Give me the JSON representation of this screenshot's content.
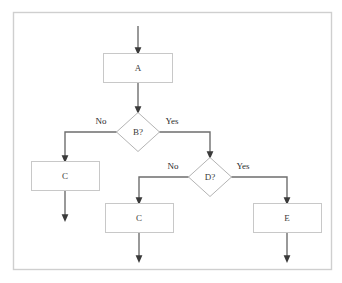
{
  "diagram": {
    "type": "flowchart",
    "frame": {
      "visible": true,
      "border_color": "#cfcfcf"
    },
    "colors": {
      "box_stroke": "#c8c8c8",
      "diamond_stroke": "#b4b4b4",
      "connector": "#6e6e6e",
      "text": "#3b3b3b",
      "background": "#ffffff"
    },
    "nodes": [
      {
        "id": "A",
        "label": "A",
        "shape": "process"
      },
      {
        "id": "B",
        "label": "B?",
        "shape": "decision"
      },
      {
        "id": "C1",
        "label": "C",
        "shape": "process"
      },
      {
        "id": "D",
        "label": "D?",
        "shape": "decision"
      },
      {
        "id": "C2",
        "label": "C",
        "shape": "process"
      },
      {
        "id": "E",
        "label": "E",
        "shape": "process"
      }
    ],
    "edge_labels": {
      "b_no": "No",
      "b_yes": "Yes",
      "d_no": "No",
      "d_yes": "Yes"
    },
    "edges": [
      {
        "from": "start",
        "to": "A",
        "label": ""
      },
      {
        "from": "A",
        "to": "B",
        "label": ""
      },
      {
        "from": "B",
        "to": "C1",
        "label": "No"
      },
      {
        "from": "B",
        "to": "D",
        "label": "Yes"
      },
      {
        "from": "D",
        "to": "C2",
        "label": "No"
      },
      {
        "from": "D",
        "to": "E",
        "label": "Yes"
      },
      {
        "from": "C1",
        "to": "end",
        "label": ""
      },
      {
        "from": "C2",
        "to": "end",
        "label": ""
      },
      {
        "from": "E",
        "to": "end",
        "label": ""
      }
    ]
  }
}
